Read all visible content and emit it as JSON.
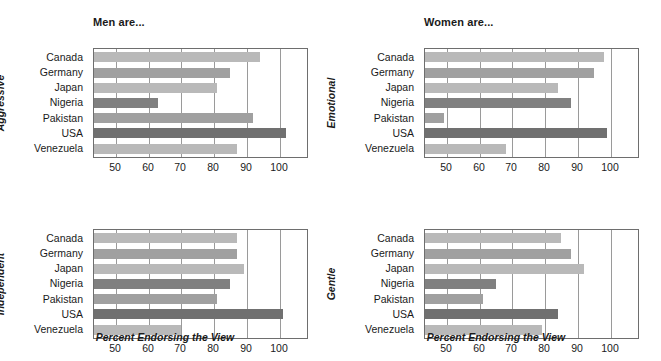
{
  "figure": {
    "xaxis_title": "Percent Endorsing the View"
  },
  "panels": [
    {
      "key": "tl",
      "title": "Men are...",
      "group_label": "Aggressive",
      "show_xaxis_title": false
    },
    {
      "key": "tr",
      "title": "Women are...",
      "group_label": "Emotional",
      "show_xaxis_title": false
    },
    {
      "key": "bl",
      "title": "",
      "group_label": "Independent",
      "show_xaxis_title": true
    },
    {
      "key": "br",
      "title": "",
      "group_label": "Gentle",
      "show_xaxis_title": true
    }
  ],
  "colors": {
    "bar_light": "#b9b9b9",
    "bar_mid": "#a0a0a0",
    "bar_dark": "#808080",
    "bar_darkest": "#707070",
    "grid": "#9a9a9a",
    "axis": "#6e6e6e",
    "text": "#1a1a1a",
    "background": "#ffffff"
  },
  "chart_data": [
    {
      "type": "bar",
      "orientation": "horizontal",
      "title": "Men are...",
      "subtitle": "Aggressive",
      "xlabel": "Percent Endorsing the View",
      "ylabel": "Aggressive",
      "xlim": [
        43.3,
        109.0
      ],
      "xticks": [
        50,
        60,
        70,
        80,
        90,
        100
      ],
      "grid": true,
      "legend": "none",
      "categories": [
        "Canada",
        "Germany",
        "Japan",
        "Nigeria",
        "Pakistan",
        "USA",
        "Venezuela"
      ],
      "values": [
        94,
        85,
        81,
        63,
        92,
        102,
        87
      ],
      "bar_colors": [
        "#b9b9b9",
        "#a0a0a0",
        "#b9b9b9",
        "#808080",
        "#a0a0a0",
        "#707070",
        "#b9b9b9"
      ]
    },
    {
      "type": "bar",
      "orientation": "horizontal",
      "title": "Women are...",
      "subtitle": "Emotional",
      "xlabel": "Percent Endorsing the View",
      "ylabel": "Emotional",
      "xlim": [
        43.3,
        109.0
      ],
      "xticks": [
        50,
        60,
        70,
        80,
        90,
        100
      ],
      "grid": true,
      "legend": "none",
      "categories": [
        "Canada",
        "Germany",
        "Japan",
        "Nigeria",
        "Pakistan",
        "USA",
        "Venezuela"
      ],
      "values": [
        98,
        95,
        84,
        88,
        49,
        99,
        68
      ],
      "bar_colors": [
        "#b9b9b9",
        "#a0a0a0",
        "#b9b9b9",
        "#808080",
        "#a0a0a0",
        "#707070",
        "#b9b9b9"
      ]
    },
    {
      "type": "bar",
      "orientation": "horizontal",
      "title": "",
      "subtitle": "Independent",
      "xlabel": "Percent Endorsing the View",
      "ylabel": "Independent",
      "xlim": [
        43.3,
        109.0
      ],
      "xticks": [
        50,
        60,
        70,
        80,
        90,
        100
      ],
      "grid": true,
      "legend": "none",
      "categories": [
        "Canada",
        "Germany",
        "Japan",
        "Nigeria",
        "Pakistan",
        "USA",
        "Venezuela"
      ],
      "values": [
        87,
        87,
        89,
        85,
        81,
        101,
        70
      ],
      "bar_colors": [
        "#b9b9b9",
        "#a0a0a0",
        "#b9b9b9",
        "#808080",
        "#a0a0a0",
        "#707070",
        "#b9b9b9"
      ]
    },
    {
      "type": "bar",
      "orientation": "horizontal",
      "title": "",
      "subtitle": "Gentle",
      "xlabel": "Percent Endorsing the View",
      "ylabel": "Gentle",
      "xlim": [
        43.3,
        109.0
      ],
      "xticks": [
        50,
        60,
        70,
        80,
        90,
        100
      ],
      "grid": true,
      "legend": "none",
      "categories": [
        "Canada",
        "Germany",
        "Japan",
        "Nigeria",
        "Pakistan",
        "USA",
        "Venezuela"
      ],
      "values": [
        85,
        88,
        92,
        65,
        61,
        84,
        79
      ],
      "bar_colors": [
        "#b9b9b9",
        "#a0a0a0",
        "#b9b9b9",
        "#808080",
        "#a0a0a0",
        "#707070",
        "#b9b9b9"
      ]
    }
  ]
}
